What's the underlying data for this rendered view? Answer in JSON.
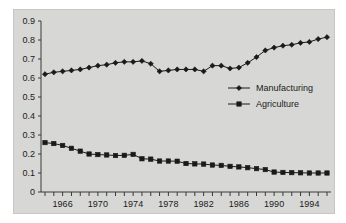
{
  "chart_data": {
    "type": "line",
    "title": "",
    "subtitle": "",
    "xlabel": "",
    "ylabel": "",
    "x": [
      1964,
      1965,
      1966,
      1967,
      1968,
      1969,
      1970,
      1971,
      1972,
      1973,
      1974,
      1975,
      1976,
      1977,
      1978,
      1979,
      1980,
      1981,
      1982,
      1983,
      1984,
      1985,
      1986,
      1987,
      1988,
      1989,
      1990,
      1991,
      1992,
      1993,
      1994,
      1995,
      1996
    ],
    "xlim": [
      1964,
      1996
    ],
    "ylim": [
      0,
      0.9
    ],
    "xticks": [
      1964,
      1965,
      1966,
      1967,
      1968,
      1969,
      1970,
      1971,
      1972,
      1973,
      1974,
      1975,
      1976,
      1977,
      1978,
      1979,
      1980,
      1981,
      1982,
      1983,
      1984,
      1985,
      1986,
      1987,
      1988,
      1989,
      1990,
      1991,
      1992,
      1993,
      1994,
      1995,
      1996
    ],
    "xtick_labels": [
      "",
      "",
      "1966",
      "",
      "",
      "",
      "1970",
      "",
      "",
      "",
      "1974",
      "",
      "",
      "",
      "1978",
      "",
      "",
      "",
      "1982",
      "",
      "",
      "",
      "1986",
      "",
      "",
      "",
      "1990",
      "",
      "",
      "",
      "1994",
      "",
      ""
    ],
    "yticks": [
      0,
      0.1,
      0.2,
      0.3,
      0.4,
      0.5,
      0.6,
      0.7,
      0.8,
      0.9
    ],
    "ytick_labels": [
      "0",
      "0.1",
      "0.2",
      "0.3",
      "0.4",
      "0.5",
      "0.6",
      "0.7",
      "0.8",
      "0.9"
    ],
    "grid": false,
    "legend_position": "center-right",
    "series": [
      {
        "name": "Manufacturing",
        "marker": "diamond",
        "color": "#1a1a1a",
        "values": [
          0.62,
          0.63,
          0.635,
          0.64,
          0.645,
          0.655,
          0.665,
          0.67,
          0.68,
          0.685,
          0.685,
          0.69,
          0.675,
          0.635,
          0.64,
          0.645,
          0.645,
          0.645,
          0.635,
          0.665,
          0.665,
          0.65,
          0.655,
          0.68,
          0.71,
          0.745,
          0.76,
          0.77,
          0.775,
          0.785,
          0.79,
          0.805,
          0.815
        ]
      },
      {
        "name": "Agriculture",
        "marker": "square",
        "color": "#1a1a1a",
        "values": [
          0.26,
          0.255,
          0.245,
          0.23,
          0.215,
          0.2,
          0.197,
          0.195,
          0.192,
          0.193,
          0.198,
          0.175,
          0.173,
          0.163,
          0.163,
          0.162,
          0.15,
          0.148,
          0.147,
          0.142,
          0.14,
          0.135,
          0.132,
          0.128,
          0.123,
          0.118,
          0.105,
          0.103,
          0.102,
          0.101,
          0.1,
          0.1,
          0.1
        ]
      }
    ]
  },
  "legend": {
    "entries": [
      {
        "label": "Manufacturing",
        "marker": "diamond-marker-icon"
      },
      {
        "label": "Agriculture",
        "marker": "square-marker-icon"
      }
    ]
  }
}
